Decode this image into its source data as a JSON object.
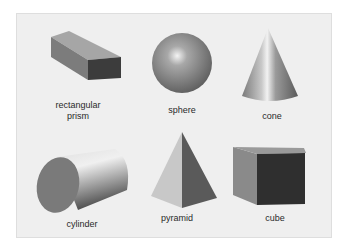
{
  "diagram": {
    "background": "#efefef",
    "shapes": [
      {
        "id": "rectangular-prism",
        "label_line1": "rectangular",
        "label_line2": "prism"
      },
      {
        "id": "sphere",
        "label": "sphere"
      },
      {
        "id": "cone",
        "label": "cone"
      },
      {
        "id": "cylinder",
        "label": "cylinder"
      },
      {
        "id": "pyramid",
        "label": "pyramid"
      },
      {
        "id": "cube",
        "label": "cube"
      }
    ]
  }
}
